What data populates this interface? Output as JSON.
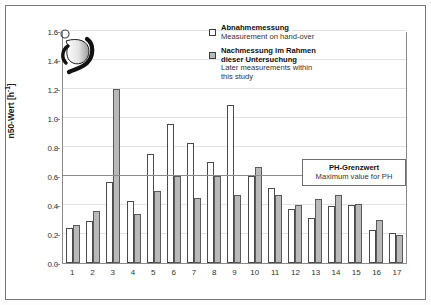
{
  "chart_data": {
    "type": "bar",
    "title": "",
    "xlabel": "",
    "ylabel": "n50-Wert [h-1]",
    "ylabel_base": "n50-Wert [h",
    "ylabel_exp": "-1",
    "ylabel_tail": "]",
    "ylim": [
      0.0,
      1.6
    ],
    "ytick_values": [
      0.0,
      0.2,
      0.4,
      0.6,
      0.8,
      1.0,
      1.2,
      1.4,
      1.6
    ],
    "ytick_labels": [
      "0.0",
      "0.2",
      "0.4",
      "0.6",
      "0.8",
      "1.0",
      "1.2",
      "1.4",
      "1.6"
    ],
    "grid": true,
    "legend_position": "top-right",
    "categories": [
      "1",
      "2",
      "3",
      "4",
      "5",
      "6",
      "7",
      "8",
      "9",
      "10",
      "11",
      "12",
      "13",
      "14",
      "15",
      "16",
      "17"
    ],
    "series": [
      {
        "name": "Abnahmemessung / Measurement on hand-over",
        "key": "handover",
        "color": "#ffffff",
        "edge_color": "#4a4a4a",
        "values": [
          0.24,
          0.29,
          0.56,
          0.43,
          0.75,
          0.96,
          0.83,
          0.7,
          1.09,
          0.6,
          0.52,
          0.37,
          0.31,
          0.39,
          0.4,
          0.23,
          0.21
        ]
      },
      {
        "name": "Nachmessung im Rahmen dieser Untersuchung / Later measurements within this study",
        "key": "later",
        "color": "#b9b9b9",
        "edge_color": "#5a5a5a",
        "values": [
          0.26,
          0.36,
          1.2,
          0.34,
          0.5,
          0.6,
          0.45,
          0.6,
          0.47,
          0.66,
          0.47,
          0.4,
          0.44,
          0.47,
          0.41,
          0.3,
          0.19
        ]
      }
    ],
    "reference_line": {
      "value": 0.6,
      "label_de": "PH-Grenzwert",
      "label_en": "Maximum value for PH"
    }
  },
  "legend": {
    "items": [
      {
        "swatch": "handover",
        "de": "Abnahmemessung",
        "en": "Measurement on hand-over"
      },
      {
        "swatch": "later",
        "de_line1": "Nachmessung im Rahmen",
        "de_line2": "dieser Untersuchung",
        "en_line1": "Later measurements within",
        "en_line2": "this study"
      }
    ]
  },
  "limit_box": {
    "de": "PH-Grenzwert",
    "en": "Maximum value for PH"
  },
  "logo": {
    "name": "rho-logo-icon"
  }
}
